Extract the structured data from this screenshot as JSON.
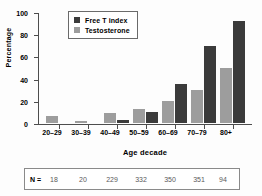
{
  "chart_data": {
    "type": "bar",
    "title": "",
    "xlabel": "Age decade",
    "ylabel": "Percentage",
    "categories": [
      "20–29",
      "30–39",
      "40–49",
      "50–59",
      "60–69",
      "70–79",
      "80+"
    ],
    "ylim": [
      0,
      100
    ],
    "yticks": [
      0,
      20,
      40,
      60,
      80,
      100
    ],
    "ytick_labels": [
      "0",
      "20",
      "40",
      "60",
      "80",
      "100"
    ],
    "grid": false,
    "legend_position": "top-center",
    "series": [
      {
        "name": "Testosterone",
        "color": "#9d9d9d",
        "values": [
          6,
          2,
          9,
          13,
          20,
          30,
          50
        ]
      },
      {
        "name": "Free T index",
        "color": "#3b3b3b",
        "values": [
          0,
          0,
          3,
          10,
          35,
          69,
          92
        ]
      }
    ],
    "annotation_table": {
      "row_label": "N =",
      "values": [
        "18",
        "20",
        "229",
        "332",
        "350",
        "351",
        "94"
      ]
    }
  },
  "legend": {
    "items": [
      {
        "label": "Free T index",
        "color": "#3b3b3b"
      },
      {
        "label": "Testosterone",
        "color": "#9d9d9d"
      }
    ]
  }
}
